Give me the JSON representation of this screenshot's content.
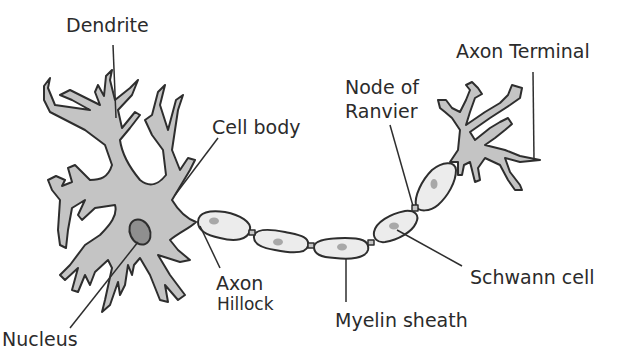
{
  "diagram": {
    "colors": {
      "cell_fill": "#c4c4c4",
      "nucleus_fill": "#8f8f8f",
      "schwann_fill": "#ececec",
      "schwann_nucleus": "#a8a8a8",
      "outline": "#2e2e2e",
      "text": "#2b2b2b"
    },
    "labels": {
      "dendrite": "Dendrite",
      "cell_body": "Cell body",
      "nucleus": "Nucleus",
      "axon": "Axon",
      "hillock": "Hillock",
      "myelin_sheath": "Myelin sheath",
      "schwann_cell": "Schwann cell",
      "node_of": "Node of",
      "ranvier": "Ranvier",
      "axon_terminal": "Axon Terminal"
    }
  }
}
